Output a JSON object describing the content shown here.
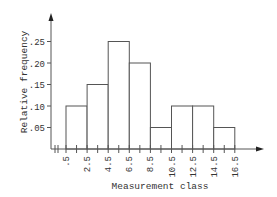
{
  "chart_data": {
    "type": "bar",
    "subtype": "histogram",
    "title": "",
    "xlabel": "Measurement class",
    "ylabel": "Relative frequency",
    "bin_edges": [
      0.5,
      2.5,
      4.5,
      6.5,
      8.5,
      10.5,
      12.5,
      14.5,
      16.5
    ],
    "x_tick_labels": [
      ".5",
      "2.5",
      "4.5",
      "6.5",
      "8.5",
      "10.5",
      "12.5",
      "14.5",
      "16.5"
    ],
    "categories": [
      "0.5-2.5",
      "2.5-4.5",
      "4.5-6.5",
      "6.5-8.5",
      "8.5-10.5",
      "10.5-12.5",
      "12.5-14.5",
      "14.5-16.5"
    ],
    "values": [
      0.1,
      0.15,
      0.25,
      0.2,
      0.05,
      0.1,
      0.1,
      0.05
    ],
    "y_ticks": [
      0.05,
      0.1,
      0.15,
      0.2,
      0.25
    ],
    "y_tick_labels": [
      ".05",
      ".10",
      ".15",
      ".20",
      ".25"
    ],
    "ylim": [
      0,
      0.3
    ],
    "grid": false,
    "legend": null,
    "axis_break_on_x": true
  }
}
